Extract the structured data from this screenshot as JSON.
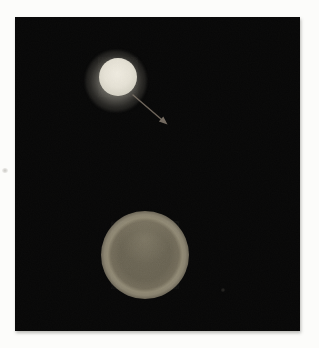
{
  "figure": {
    "kind": "photograph",
    "objects": [
      {
        "name": "bright-sphere",
        "center_x": 118,
        "center_y": 77,
        "core_radius": 19,
        "halo_radius": 31
      },
      {
        "name": "arrow-annotation",
        "from_x": 133,
        "from_y": 95,
        "tip_x": 167,
        "tip_y": 124
      },
      {
        "name": "dim-ring-sphere",
        "center_x": 145,
        "center_y": 255,
        "outer_radius": 44,
        "ring_radius": 28
      },
      {
        "name": "faint-speck",
        "center_x": 223,
        "center_y": 289
      }
    ]
  },
  "colors": {
    "margin-bg": "#fcfcfa",
    "photo-bg": "#070707",
    "core-bright": "#f0ece1",
    "core-edge": "#d2cfc2",
    "halo-gray": "#8c8a82",
    "arrow": "#80766a",
    "ring-bright": "#8f8873",
    "ring-inner": "#6a6453"
  }
}
